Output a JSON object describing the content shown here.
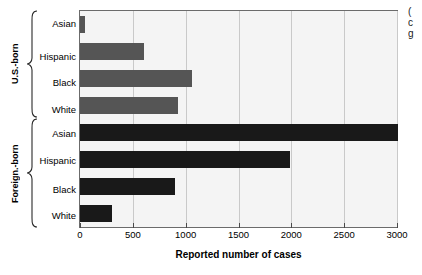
{
  "chart_data": {
    "type": "bar",
    "orientation": "horizontal",
    "title": "",
    "xlabel": "Reported number of cases",
    "ylabel": "",
    "xlim": [
      0,
      3000
    ],
    "xticks": [
      0,
      500,
      1000,
      1500,
      2000,
      2500,
      3000
    ],
    "xtick_labels": [
      "0",
      "500",
      "1000",
      "1500",
      "2000",
      "2500",
      "3000"
    ],
    "grid": true,
    "grid_axis": "x",
    "legend": "none",
    "categories": [
      "Asian",
      "Hispanic",
      "Black",
      "White",
      "Asian",
      "Hispanic",
      "Black",
      "White"
    ],
    "values": [
      50,
      610,
      1060,
      930,
      3010,
      1990,
      900,
      300
    ],
    "groups": [
      {
        "label": "U.S.-born",
        "color": "#555555",
        "categories": [
          "Asian",
          "Hispanic",
          "Black",
          "White"
        ],
        "values": [
          50,
          610,
          1060,
          930
        ]
      },
      {
        "label": "Foreign.-born",
        "color": "#191919",
        "categories": [
          "Asian",
          "Hispanic",
          "Black",
          "White"
        ],
        "values": [
          3010,
          1990,
          900,
          300
        ]
      }
    ]
  },
  "axis": {
    "x_title": "Reported number of cases",
    "ticks": [
      {
        "label": "0",
        "value": 0
      },
      {
        "label": "500",
        "value": 500
      },
      {
        "label": "1000",
        "value": 1000
      },
      {
        "label": "1500",
        "value": 1500
      },
      {
        "label": "2000",
        "value": 2000
      },
      {
        "label": "2500",
        "value": 2500
      },
      {
        "label": "3000",
        "value": 3000
      }
    ]
  },
  "groups": {
    "us_born_label": "U.S.-born",
    "foreign_born_label": "Foreign.-born"
  },
  "categories": {
    "us": [
      {
        "label": "Asian"
      },
      {
        "label": "Hispanic"
      },
      {
        "label": "Black"
      },
      {
        "label": "White"
      }
    ],
    "foreign": [
      {
        "label": "Asian"
      },
      {
        "label": "Hispanic"
      },
      {
        "label": "Black"
      },
      {
        "label": "White"
      }
    ]
  },
  "side_note": {
    "line1": "(",
    "line2": "c",
    "line3": "g"
  },
  "colors": {
    "bar_us": "#555555",
    "bar_foreign": "#191919",
    "plot_background": "#f4f4f4",
    "gridline": "#c9c9c9",
    "axis": "#6b6b6b"
  }
}
